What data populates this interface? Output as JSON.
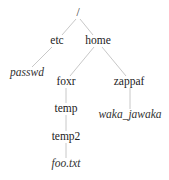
{
  "diagram": {
    "type": "directory-tree",
    "edge_color": "#c8c8c8",
    "nodes": {
      "root": {
        "label": "/",
        "kind": "directory",
        "x": 78,
        "y": 13
      },
      "etc": {
        "label": "etc",
        "kind": "directory",
        "x": 57,
        "y": 41
      },
      "home": {
        "label": "home",
        "kind": "directory",
        "x": 98,
        "y": 41
      },
      "passwd": {
        "label": "passwd",
        "kind": "file",
        "x": 27,
        "y": 73
      },
      "foxr": {
        "label": "foxr",
        "kind": "directory",
        "x": 66,
        "y": 82
      },
      "zappaf": {
        "label": "zappaf",
        "kind": "directory",
        "x": 129,
        "y": 82
      },
      "temp": {
        "label": "temp",
        "kind": "directory",
        "x": 66,
        "y": 109
      },
      "waka_jawaka": {
        "label": "waka_jawaka",
        "kind": "file",
        "x": 130,
        "y": 115
      },
      "temp2": {
        "label": "temp2",
        "kind": "directory",
        "x": 66,
        "y": 137
      },
      "foo_txt": {
        "label": "foo.txt",
        "kind": "file",
        "x": 66,
        "y": 164
      }
    },
    "edges": [
      [
        "root",
        "etc"
      ],
      [
        "root",
        "home"
      ],
      [
        "etc",
        "passwd"
      ],
      [
        "home",
        "foxr"
      ],
      [
        "home",
        "zappaf"
      ],
      [
        "foxr",
        "temp"
      ],
      [
        "zappaf",
        "waka_jawaka"
      ],
      [
        "temp",
        "temp2"
      ],
      [
        "temp2",
        "foo_txt"
      ]
    ]
  }
}
